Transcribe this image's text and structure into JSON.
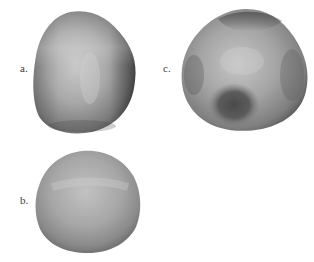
{
  "figure": {
    "panels": [
      {
        "id": "a",
        "label": "a.",
        "description": "smooth rounded-triangular blob surface, darker right edge",
        "colors": {
          "highlight": "#c9c9c9",
          "mid": "#9a9a9a",
          "shadow": "#4e4e4e"
        }
      },
      {
        "id": "b",
        "label": "b.",
        "description": "nearly spherical blob surface, soft uniform shading",
        "colors": {
          "highlight": "#c2c2c2",
          "mid": "#a2a2a2",
          "shadow": "#6e6e6e"
        }
      },
      {
        "id": "c",
        "label": "c.",
        "description": "lumpy blob surface with dark band at top and dark dimple lower-left",
        "colors": {
          "highlight": "#c6c6c6",
          "mid": "#959595",
          "shadow": "#505050"
        }
      }
    ]
  }
}
